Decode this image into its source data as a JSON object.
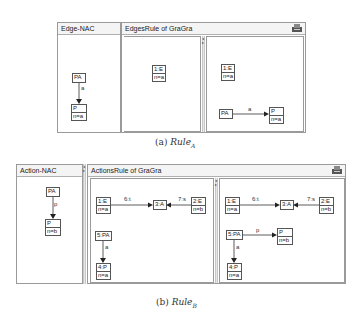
{
  "figure_a": {
    "caption_prefix": "(a)",
    "caption_rule": "Rule",
    "caption_sub": "A",
    "nac_panel": {
      "title": "Edge-NAC",
      "nodes": [
        {
          "name": "PA",
          "attr": ""
        },
        {
          "name": "P",
          "attr": "n=a"
        }
      ],
      "edges": [
        {
          "label": "a",
          "from": "PA",
          "to": "P"
        }
      ]
    },
    "rule_panel": {
      "title": "EdgesRule  of  GraGra",
      "lhs": {
        "nodes": [
          {
            "name": "1:E",
            "attr": "n=a"
          }
        ]
      },
      "rhs": {
        "nodes": [
          {
            "name": "1:E",
            "attr": "n=a"
          },
          {
            "name": "PA",
            "attr": ""
          },
          {
            "name": "P",
            "attr": "n=a"
          }
        ],
        "edges": [
          {
            "label": "a",
            "from": "PA",
            "to": "P"
          }
        ]
      }
    }
  },
  "figure_b": {
    "caption_prefix": "(b)",
    "caption_rule": "Rule",
    "caption_sub": "B",
    "nac_panel": {
      "title": "Action-NAC",
      "nodes": [
        {
          "name": "PA",
          "attr": ""
        },
        {
          "name": "P",
          "attr": "n=b"
        }
      ],
      "edges": [
        {
          "label": "p",
          "from": "PA",
          "to": "P"
        }
      ]
    },
    "rule_panel": {
      "title": "ActionsRule  of  GraGra",
      "lhs": {
        "nodes": [
          {
            "name": "1:E",
            "attr": "n=a"
          },
          {
            "name": "3:A",
            "attr": ""
          },
          {
            "name": "2:E",
            "attr": "n=b"
          },
          {
            "name": "5:PA",
            "attr": ""
          },
          {
            "name": "4:P",
            "attr": "n=a"
          }
        ],
        "edges": [
          {
            "label": "6:t",
            "from": "1:E",
            "to": "3:A"
          },
          {
            "label": "7:s",
            "from": "2:E",
            "to": "3:A"
          },
          {
            "label": "a",
            "from": "5:PA",
            "to": "4:P"
          }
        ]
      },
      "rhs": {
        "nodes": [
          {
            "name": "1:E",
            "attr": "n=a"
          },
          {
            "name": "3:A",
            "attr": ""
          },
          {
            "name": "2:E",
            "attr": "n=b"
          },
          {
            "name": "5:PA",
            "attr": ""
          },
          {
            "name": "P",
            "attr": "n=b"
          },
          {
            "name": "4:P",
            "attr": "n=a"
          }
        ],
        "edges": [
          {
            "label": "6:t",
            "from": "1:E",
            "to": "3:A"
          },
          {
            "label": "7:s",
            "from": "2:E",
            "to": "3:A"
          },
          {
            "label": "p",
            "from": "5:PA",
            "to": "P"
          },
          {
            "label": "a",
            "from": "5:PA",
            "to": "4:P"
          }
        ]
      }
    }
  },
  "icons": {
    "window_menu": "printer-icon",
    "splitter": "splitter-arrows-icon"
  }
}
